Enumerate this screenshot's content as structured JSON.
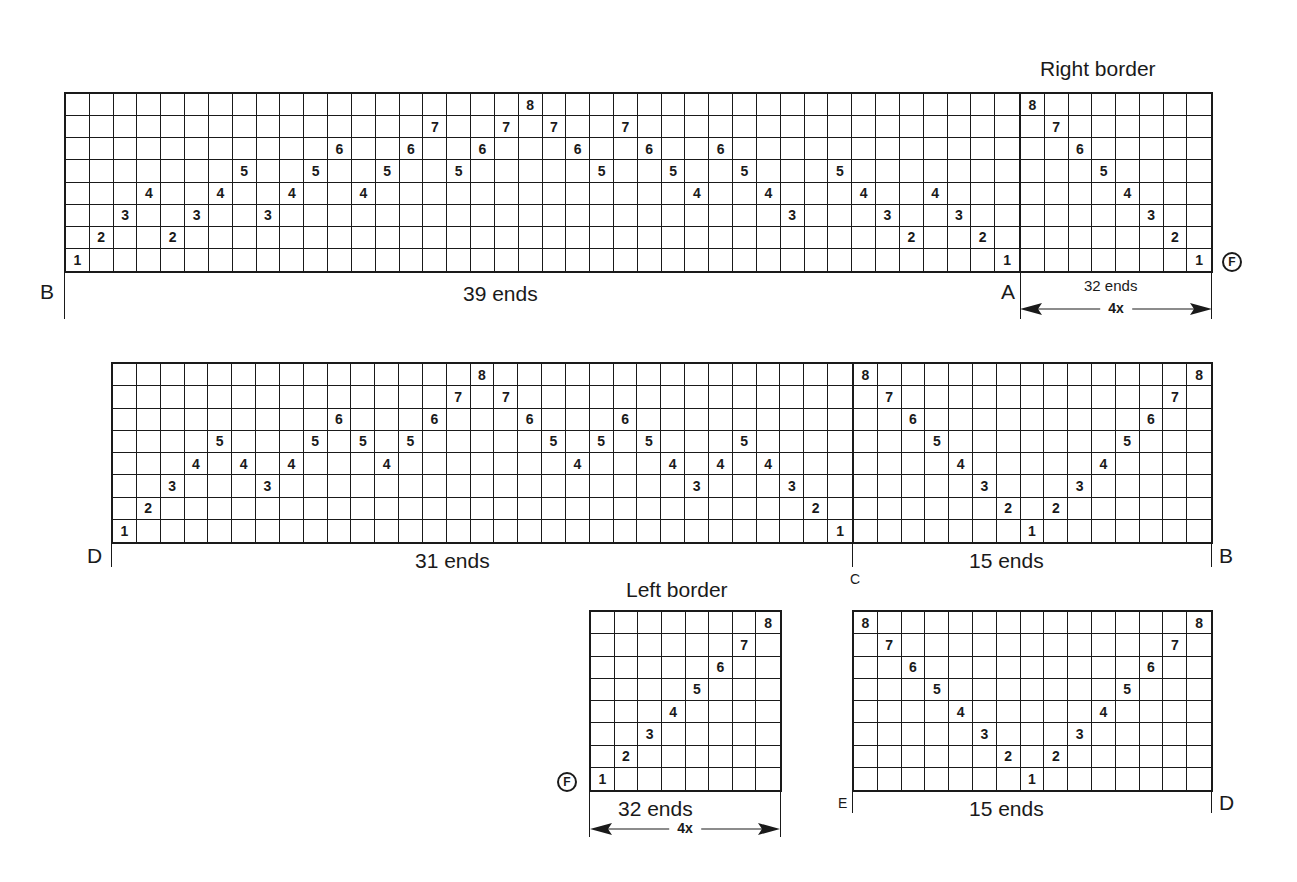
{
  "colors": {
    "ink": "#1a1a1a",
    "background": "#ffffff"
  },
  "blocks": [
    {
      "id": "top-main",
      "left": 64,
      "top": 92,
      "width": 957,
      "height": 181,
      "rows": 8,
      "columns": [
        1,
        2,
        3,
        4,
        2,
        3,
        4,
        5,
        3,
        4,
        5,
        6,
        4,
        5,
        6,
        7,
        5,
        6,
        7,
        8,
        7,
        6,
        5,
        7,
        6,
        5,
        4,
        6,
        5,
        4,
        3,
        null,
        5,
        4,
        3,
        2,
        4,
        3,
        2,
        1
      ]
    },
    {
      "id": "right-border",
      "left": 1019,
      "top": 92,
      "width": 194,
      "height": 181,
      "rows": 8,
      "columns": [
        8,
        7,
        6,
        5,
        4,
        3,
        2,
        1
      ]
    },
    {
      "id": "middle-main",
      "left": 111,
      "top": 362,
      "width": 743,
      "height": 182,
      "rows": 8,
      "columns": [
        1,
        2,
        3,
        4,
        5,
        4,
        3,
        4,
        5,
        6,
        5,
        4,
        5,
        6,
        7,
        8,
        7,
        6,
        5,
        4,
        5,
        6,
        5,
        4,
        3,
        4,
        5,
        4,
        3,
        2,
        1
      ]
    },
    {
      "id": "middle-right",
      "left": 852,
      "top": 362,
      "width": 361,
      "height": 182,
      "rows": 8,
      "columns": [
        8,
        7,
        6,
        5,
        4,
        3,
        2,
        1,
        2,
        3,
        4,
        5,
        6,
        7,
        8
      ]
    },
    {
      "id": "left-border",
      "left": 589,
      "top": 610,
      "width": 193,
      "height": 182,
      "rows": 8,
      "columns": [
        1,
        2,
        3,
        4,
        5,
        6,
        7,
        8
      ]
    },
    {
      "id": "bottom-right",
      "left": 852,
      "top": 610,
      "width": 361,
      "height": 182,
      "rows": 8,
      "columns": [
        8,
        7,
        6,
        5,
        4,
        3,
        2,
        1,
        2,
        3,
        4,
        5,
        6,
        7,
        8
      ]
    }
  ],
  "labels": {
    "right_border_title": "Right border",
    "left_border_title": "Left border",
    "top_main_ends": "39 ends",
    "right_border_ends": "32 ends",
    "right_border_repeat": "4x",
    "middle_main_ends": "31 ends",
    "middle_right_ends": "15 ends",
    "left_border_ends": "32 ends",
    "left_border_repeat": "4x",
    "bottom_right_ends": "15 ends",
    "point_a": "A",
    "point_b_top": "B",
    "point_b_middle": "B",
    "point_c": "C",
    "point_d_middle": "D",
    "point_d_bottom": "D",
    "point_e": "E",
    "marker_f": "F"
  }
}
